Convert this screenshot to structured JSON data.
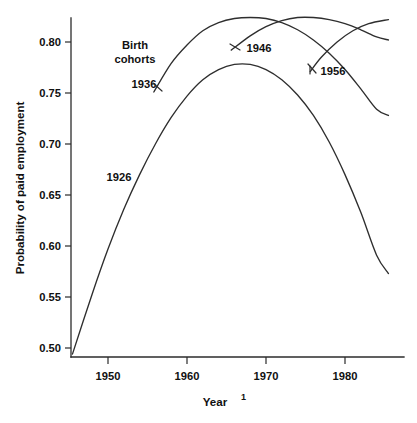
{
  "chart_data": {
    "type": "line",
    "title": "",
    "xlabel": "Year",
    "xlabel_footnote": "1",
    "ylabel": "Probability of paid employment",
    "xlim": [
      1945,
      1986
    ],
    "ylim": [
      0.485,
      0.835
    ],
    "grid": false,
    "legend_position": "inside-upper-left",
    "legend_title_line1": "Birth",
    "legend_title_line2": "cohorts",
    "xticks": [
      1950,
      1960,
      1970,
      1980
    ],
    "xtick_labels": [
      "1950",
      "1960",
      "1970",
      "1980"
    ],
    "yticks": [
      0.5,
      0.55,
      0.6,
      0.65,
      0.7,
      0.75,
      0.8
    ],
    "ytick_labels": [
      "0.50",
      "0.55",
      "0.60",
      "0.65",
      "0.70",
      "0.75",
      "0.80"
    ],
    "series": [
      {
        "name": "1926",
        "label": "1926",
        "x": [
          1945.5,
          1948,
          1950,
          1952,
          1954,
          1956,
          1958,
          1960,
          1962,
          1964,
          1966,
          1968,
          1970,
          1972,
          1974,
          1976,
          1978,
          1980,
          1982,
          1984,
          1985.5
        ],
        "values": [
          0.494,
          0.553,
          0.597,
          0.636,
          0.67,
          0.7,
          0.726,
          0.747,
          0.763,
          0.773,
          0.778,
          0.778,
          0.773,
          0.763,
          0.748,
          0.728,
          0.702,
          0.67,
          0.633,
          0.591,
          0.573
        ]
      },
      {
        "name": "1936",
        "label": "1936",
        "x": [
          1955.8,
          1958,
          1960,
          1962,
          1964,
          1966,
          1968,
          1970,
          1972,
          1974,
          1976,
          1978,
          1980,
          1982,
          1984,
          1985.5
        ],
        "values": [
          0.751,
          0.779,
          0.797,
          0.811,
          0.819,
          0.823,
          0.824,
          0.823,
          0.819,
          0.812,
          0.802,
          0.789,
          0.773,
          0.754,
          0.734,
          0.728
        ]
      },
      {
        "name": "1946",
        "label": "1946",
        "x": [
          1965.6,
          1968,
          1970,
          1972,
          1974,
          1976,
          1978,
          1980,
          1982,
          1984,
          1985.5
        ],
        "values": [
          0.792,
          0.806,
          0.815,
          0.821,
          0.824,
          0.824,
          0.822,
          0.818,
          0.812,
          0.805,
          0.802
        ]
      },
      {
        "name": "1956",
        "label": "1956",
        "x": [
          1975.6,
          1977,
          1979,
          1981,
          1983,
          1985.5
        ],
        "values": [
          0.771,
          0.785,
          0.8,
          0.811,
          0.818,
          0.822
        ]
      }
    ]
  },
  "figure": {
    "background_color": "#ffffff",
    "line_color": "#2e2e2e",
    "text_color": "#111111"
  }
}
